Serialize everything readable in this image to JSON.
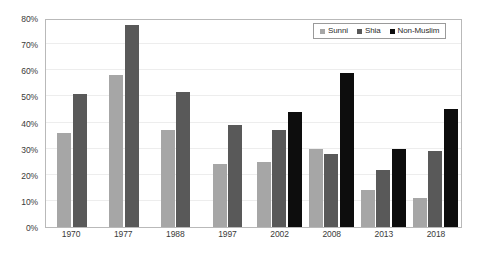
{
  "chart_data": {
    "type": "bar",
    "title": "",
    "xlabel": "",
    "ylabel": "",
    "ylim": [
      0,
      80
    ],
    "ytick_labels": [
      "0%",
      "10%",
      "20%",
      "30%",
      "40%",
      "50%",
      "60%",
      "70%",
      "80%"
    ],
    "ytick_values": [
      0,
      10,
      20,
      30,
      40,
      50,
      60,
      70,
      80
    ],
    "grid": true,
    "legend_position": "top-right",
    "categories": [
      "1970",
      "1977",
      "1988",
      "1997",
      "2002",
      "2008",
      "2013",
      "2018"
    ],
    "series": [
      {
        "name": "Sunni",
        "color": "#a6a6a6",
        "values": [
          36,
          58,
          37,
          24,
          25,
          30,
          14,
          11
        ]
      },
      {
        "name": "Shia",
        "color": "#595959",
        "values": [
          51,
          77.5,
          51.5,
          39,
          37,
          28,
          22,
          29
        ]
      },
      {
        "name": "Non-Muslim",
        "color": "#0d0d0d",
        "values": [
          null,
          null,
          null,
          null,
          44,
          59,
          30,
          45
        ]
      }
    ]
  },
  "legend": {
    "items": [
      {
        "label": "Sunni",
        "color": "#a6a6a6"
      },
      {
        "label": "Shia",
        "color": "#595959"
      },
      {
        "label": "Non-Muslim",
        "color": "#0d0d0d"
      }
    ]
  },
  "colors": {
    "plot_border": "#b9b9b9",
    "gridline": "#ededed",
    "axis_text": "#3a3a3a",
    "background": "#ffffff"
  }
}
